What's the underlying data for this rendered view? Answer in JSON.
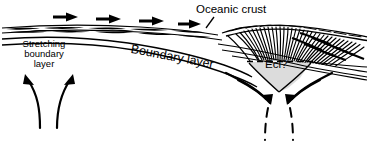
{
  "diagram": {
    "type": "geological-cross-section",
    "background_color": "#ffffff",
    "line_color": "#000000",
    "wedge_fill_color": "#dcdcdc",
    "labels": {
      "oceanic_crust": "Oceanic crust",
      "stretching_line1": "Stretching",
      "stretching_line2": "boundary",
      "stretching_line3": "layer",
      "boundary_layer": "Boundary layer",
      "eclogite": "Ecl?"
    },
    "features": {
      "plate_motion_arrows": 4,
      "plate_motion_direction": "right",
      "upwelling_arrows": 2,
      "upwelling_direction": "up-diverging",
      "downwelling_arrows": 2,
      "downwelling_direction": "down-converging",
      "imbricate_fan_strokes": 34,
      "dashed_continuations": 2
    }
  }
}
